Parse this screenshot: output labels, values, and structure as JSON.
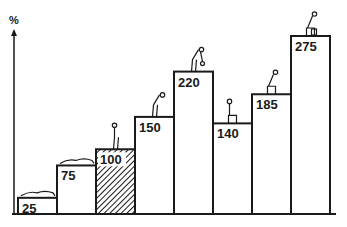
{
  "chart_data": {
    "type": "bar",
    "title": "",
    "xlabel": "",
    "ylabel": "%",
    "categories": [
      "lying supine",
      "lying prone",
      "standing upright",
      "standing bent forward",
      "standing bent forward with weight",
      "sitting upright",
      "sitting bent forward",
      "sitting bent forward with weight"
    ],
    "values": [
      25,
      75,
      100,
      150,
      220,
      140,
      185,
      275
    ],
    "value_labels": [
      "25",
      "75",
      "100",
      "150",
      "220",
      "140",
      "185",
      "275"
    ],
    "reference_index": 2,
    "reference_fill": "hatched",
    "ylim": [
      0,
      300
    ],
    "grid": false,
    "legend": null
  },
  "colors": {
    "ink": "#1a1a1a",
    "background": "#ffffff"
  }
}
